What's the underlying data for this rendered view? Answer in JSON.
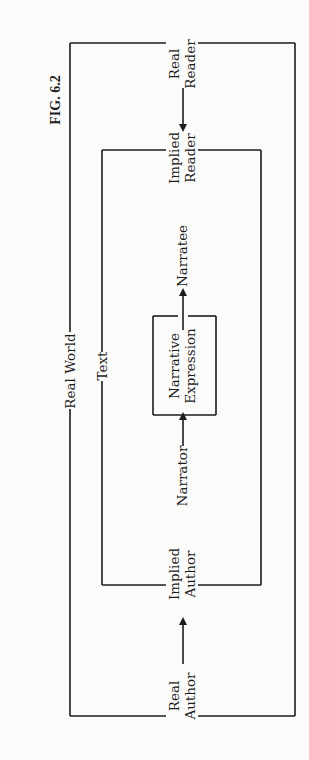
{
  "figure": {
    "label": "FIG. 6.2"
  },
  "frames": {
    "outer": {
      "label": "Real World"
    },
    "inner": {
      "label": "Text"
    },
    "core": {
      "label_line1": "Narrative",
      "label_line2": "Expression"
    }
  },
  "nodes": {
    "real_author": {
      "line1": "Real",
      "line2": "Author"
    },
    "implied_author": {
      "line1": "Implied",
      "line2": "Author"
    },
    "narrator": {
      "label": "Narrator"
    },
    "narratee": {
      "label": "Narratee"
    },
    "implied_reader": {
      "line1": "Implied",
      "line2": "Reader"
    },
    "real_reader": {
      "line1": "Real",
      "line2": "Reader"
    }
  },
  "flow": [
    "Real Author",
    "Implied Author",
    "Narrator",
    "Narrative Expression",
    "Narratee",
    "Implied Reader",
    "Real Reader"
  ],
  "colors": {
    "ink": "#1c1c1c",
    "paper": "#fbfbfa"
  }
}
